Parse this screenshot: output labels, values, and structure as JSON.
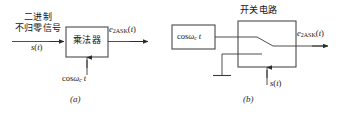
{
  "figure": {
    "background_color": "#ffffff",
    "line_color": "#3a3a3a",
    "text_color": "#151515"
  },
  "part_a": {
    "caption": "(a)",
    "input_label_line1": "二进制",
    "input_label_line2": "不归零信号",
    "input_signal": "s(t)",
    "block_label": "乘法器",
    "carrier_label": "cosω c t",
    "output_label": "e 2ASK (t)",
    "output_label_parts": {
      "base": "e",
      "sub": "2ASK",
      "arg": "(t)"
    },
    "carrier_parts": {
      "fn": "cos",
      "omega": "ω",
      "sub": "c",
      "var": "t"
    }
  },
  "part_b": {
    "caption": "(b)",
    "block_title": "开关电路",
    "source_label": "cosω c t",
    "control_signal": "s(t)",
    "output_label": "e 2ASK (t)",
    "output_label_parts": {
      "base": "e",
      "sub": "2ASK",
      "arg": "(t)"
    },
    "source_parts": {
      "fn": "cos",
      "omega": "ω",
      "sub": "c",
      "var": "t"
    },
    "ground_icon": "ground-icon",
    "switch_icon": "switch-icon"
  }
}
